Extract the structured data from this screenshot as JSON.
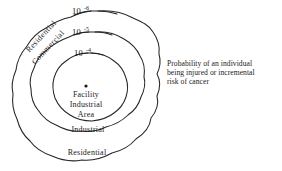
{
  "figure": {
    "title": "",
    "background_color": "#ffffff",
    "line_color": "#252525",
    "contours": [
      {
        "name": "outer",
        "label_base": "10",
        "label_exponent": "-6",
        "zone_label": "Residential"
      },
      {
        "name": "middle",
        "label_base": "10",
        "label_exponent": "-5",
        "zone_label": "Industrial"
      },
      {
        "name": "inner",
        "label_base": "10",
        "label_exponent": "-4",
        "zone_label": ""
      }
    ],
    "diagonal_labels": [
      {
        "text": "Residential"
      },
      {
        "text": "Commercial"
      }
    ],
    "center": {
      "marker": "facility-point-marker",
      "lines": [
        "Facility",
        "Industrial",
        "Area"
      ]
    },
    "caption": {
      "lines": [
        "Probability of an individual",
        "being injured or incremental",
        "risk of cancer"
      ]
    }
  }
}
